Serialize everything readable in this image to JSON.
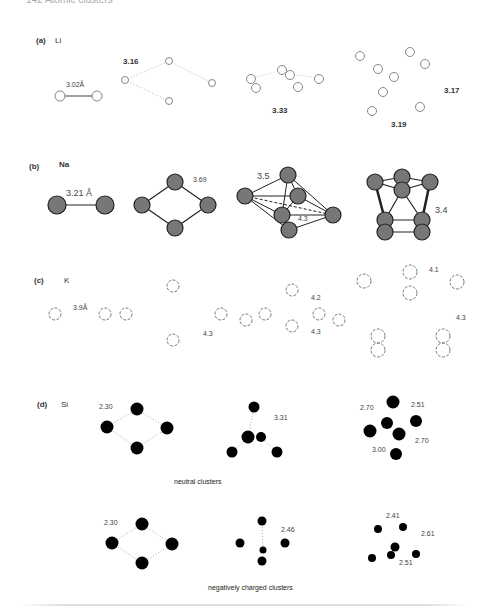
{
  "page": {
    "header_text": "142    Atomic clusters"
  },
  "panels": [
    {
      "id": "a",
      "label": "(a)",
      "element": "Li",
      "bond_labels": [
        "3.02Å",
        "3.16",
        "3.33",
        "3.17",
        "3.19"
      ]
    },
    {
      "id": "b",
      "label": "(b)",
      "element": "Na",
      "bond_labels": [
        "3.21 Å",
        "3.69",
        "3.5",
        "4.3",
        "3.4"
      ]
    },
    {
      "id": "c",
      "label": "(c)",
      "element": "K",
      "bond_labels": [
        "3.9Å",
        "4.3",
        "4.2",
        "4.3",
        "4.1",
        "4.3"
      ]
    },
    {
      "id": "d",
      "label": "(d)",
      "element": "Si",
      "neutral": {
        "bond_labels": [
          "2.30",
          "3.31",
          "2.70",
          "2.51",
          "2.70",
          "3.00"
        ],
        "caption": "neutral clusters"
      },
      "anion": {
        "bond_labels": [
          "2.30",
          "2.46",
          "2.41",
          "2.61",
          "2.51"
        ],
        "caption": "negatively charged clusters"
      }
    }
  ]
}
